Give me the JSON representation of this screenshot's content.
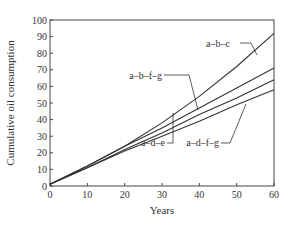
{
  "chart_data": {
    "type": "line",
    "title": "",
    "xlabel": "Years",
    "ylabel": "Cumulative oil consumption",
    "xlim": [
      0,
      60
    ],
    "ylim": [
      0,
      100
    ],
    "x_ticks": [
      0,
      10,
      20,
      30,
      40,
      50,
      60
    ],
    "y_ticks": [
      0,
      10,
      20,
      30,
      40,
      50,
      60,
      70,
      80,
      90,
      100
    ],
    "grid": false,
    "legend": "inline annotations with leader lines",
    "x": [
      0,
      10,
      20,
      30,
      40,
      50,
      60
    ],
    "series": [
      {
        "name": "a–b–c",
        "values": [
          1,
          12,
          24,
          38,
          54,
          72,
          92
        ]
      },
      {
        "name": "a–b–f–g",
        "values": [
          1,
          12,
          24,
          35,
          47,
          59,
          71
        ]
      },
      {
        "name": "a–d–e",
        "values": [
          1,
          11,
          22,
          32,
          43,
          53,
          64
        ]
      },
      {
        "name": "a–d–f–g",
        "values": [
          1,
          11,
          21,
          30,
          39,
          49,
          58
        ]
      }
    ]
  }
}
